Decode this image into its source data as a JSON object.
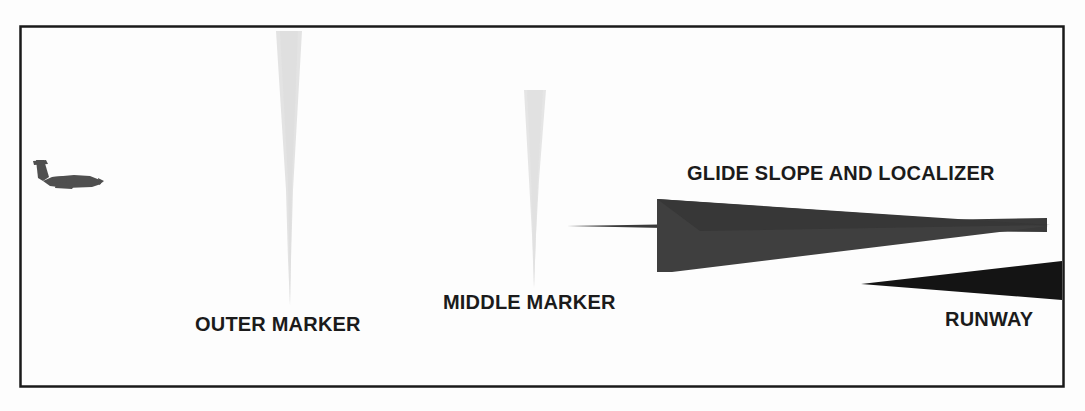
{
  "diagram": {
    "background_color": "#fdfdfd",
    "border_color": "#1a1a1a",
    "border": {
      "x": 20,
      "y": 26,
      "width": 1043,
      "height": 360
    }
  },
  "labels": {
    "outer_marker": "OUTER MARKER",
    "middle_marker": "MIDDLE MARKER",
    "glide_slope": "GLIDE SLOPE AND LOCALIZER",
    "runway": "RUNWAY"
  },
  "shapes": {
    "aircraft": {
      "name": "aircraft-silhouette",
      "color": "#4a4a4a",
      "x": 30,
      "y": 160,
      "width": 72,
      "height": 34
    },
    "outer_marker_cone": {
      "name": "outer-marker-cone",
      "color": "#e2e2e2",
      "top_left_x": 276,
      "top_right_x": 302,
      "top_y": 31,
      "tip_x": 290,
      "tip_y": 306
    },
    "middle_marker_cone": {
      "name": "middle-marker-cone",
      "color": "#e4e4e4",
      "top_left_x": 524,
      "top_right_x": 546,
      "top_y": 90,
      "tip_x": 534,
      "tip_y": 288
    },
    "localizer_beam": {
      "name": "localizer-beam",
      "color": "#3a3a3a",
      "tip_x": 567,
      "tip_y": 226,
      "right_x": 1047,
      "right_top_y": 218,
      "right_bottom_y": 232
    },
    "glide_slope_cone": {
      "name": "glide-slope-cone",
      "color": "#3d3d3d",
      "left_x": 657,
      "left_top_y": 199,
      "left_bottom_y": 272,
      "tip_x": 1048,
      "tip_y": 226
    },
    "runway_wedge": {
      "name": "runway-wedge",
      "color": "#141414",
      "tip_x": 861,
      "tip_y": 284,
      "right_x": 1062,
      "right_top_y": 261,
      "right_bottom_y": 300
    }
  },
  "colors": {
    "ink": "#1b1b1b",
    "beam_dark": "#3d3d3d",
    "beam_light": "#e2e2e2",
    "runway_black": "#141414"
  }
}
